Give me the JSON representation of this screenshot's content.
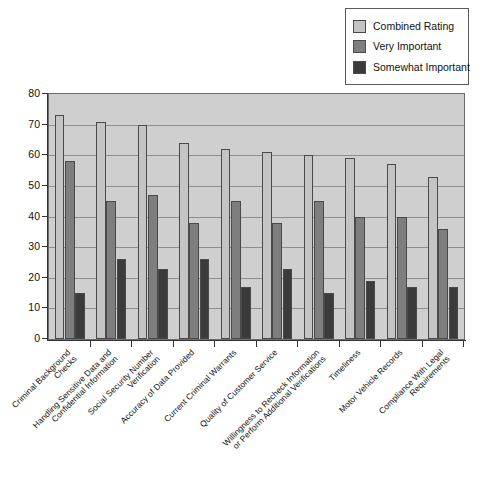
{
  "chart_data": {
    "type": "bar",
    "title": "",
    "xlabel": "",
    "ylabel": "",
    "ylim": [
      0,
      80
    ],
    "ytick_step": 10,
    "yticks": [
      0,
      10,
      20,
      30,
      40,
      50,
      60,
      70,
      80
    ],
    "grid": true,
    "legend_position": "top-right",
    "categories": [
      "Criminal Background\nChecks",
      "Handling Sensitive Data and\nConfidential Information",
      "Social Security Number\nVerification",
      "Accuracy of Data Provided",
      "Current Criminal Warrants",
      "Quality of Customer Service",
      "Willingness to Recheck Information\nor Perform Additional Verifications",
      "Timeliness",
      "Motor Vehicle Records",
      "Compliance With Legal\nRequirements"
    ],
    "series": [
      {
        "name": "Combined Rating",
        "color": "#c4c4c4",
        "values": [
          73,
          71,
          70,
          64,
          62,
          61,
          60,
          59,
          57,
          53
        ]
      },
      {
        "name": "Very Important",
        "color": "#7e7e7e",
        "values": [
          58,
          45,
          47,
          38,
          45,
          38,
          45,
          40,
          40,
          36
        ]
      },
      {
        "name": "Somewhat Important",
        "color": "#3b3b3b",
        "values": [
          15,
          26,
          23,
          26,
          17,
          23,
          15,
          19,
          17,
          17
        ]
      }
    ]
  },
  "legend": {
    "items": [
      {
        "label": "Combined Rating",
        "color": "#c4c4c4"
      },
      {
        "label": "Very Important",
        "color": "#7e7e7e"
      },
      {
        "label": "Somewhat Important",
        "color": "#3b3b3b"
      }
    ]
  },
  "colors": {
    "plot_background": "#cfcfcf",
    "gridline": "#8e8e8e",
    "axis": "#333333",
    "page_background": "#ffffff"
  }
}
